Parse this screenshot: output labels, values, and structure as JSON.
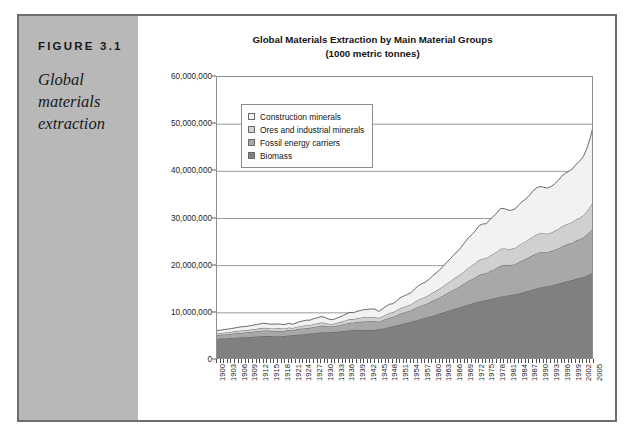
{
  "figure": {
    "number_label": "FIGURE 3.1",
    "caption": "Global materials extraction"
  },
  "chart": {
    "title_line1": "Global Materials Extraction by Main Material Groups",
    "title_line2": "(1000 metric tonnes)"
  },
  "legend": {
    "position": "inside-upper-left",
    "items": [
      {
        "label": "Construction minerals",
        "color": "#f2f2f2"
      },
      {
        "label": "Ores and industrial minerals",
        "color": "#d0d0d0"
      },
      {
        "label": "Fossil energy carriers",
        "color": "#a8a8a8"
      },
      {
        "label": "Biomass",
        "color": "#808080"
      }
    ]
  },
  "axes": {
    "y_tick_labels": [
      "0",
      "10,000,000",
      "20,000,000",
      "30,000,000",
      "40,000,000",
      "50,000,000",
      "60,000,000"
    ],
    "y_tick_values": [
      0,
      10000000,
      20000000,
      30000000,
      40000000,
      50000000,
      60000000
    ],
    "x_tick_labels": [
      "1900",
      "1903",
      "1906",
      "1909",
      "1912",
      "1915",
      "1918",
      "1921",
      "1924",
      "1927",
      "1930",
      "1933",
      "1936",
      "1939",
      "1942",
      "1945",
      "1948",
      "1951",
      "1954",
      "1957",
      "1960",
      "1963",
      "1966",
      "1969",
      "1972",
      "1975",
      "1978",
      "1981",
      "1984",
      "1987",
      "1990",
      "1993",
      "1996",
      "1999",
      "2002",
      "2005"
    ]
  },
  "chart_data": {
    "type": "area",
    "stacked": true,
    "title": "Global Materials Extraction by Main Material Groups (1000 metric tonnes)",
    "xlabel": "",
    "ylabel": "",
    "ylim": [
      0,
      60000000
    ],
    "xlim": [
      1900,
      2005
    ],
    "grid": true,
    "grid_axis": "y",
    "legend_position": "inside-upper-left",
    "units": "1000 metric tonnes",
    "x": [
      1900,
      1901,
      1902,
      1903,
      1904,
      1905,
      1906,
      1907,
      1908,
      1909,
      1910,
      1911,
      1912,
      1913,
      1914,
      1915,
      1916,
      1917,
      1918,
      1919,
      1920,
      1921,
      1922,
      1923,
      1924,
      1925,
      1926,
      1927,
      1928,
      1929,
      1930,
      1931,
      1932,
      1933,
      1934,
      1935,
      1936,
      1937,
      1938,
      1939,
      1940,
      1941,
      1942,
      1943,
      1944,
      1945,
      1946,
      1947,
      1948,
      1949,
      1950,
      1951,
      1952,
      1953,
      1954,
      1955,
      1956,
      1957,
      1958,
      1959,
      1960,
      1961,
      1962,
      1963,
      1964,
      1965,
      1966,
      1967,
      1968,
      1969,
      1970,
      1971,
      1972,
      1973,
      1974,
      1975,
      1976,
      1977,
      1978,
      1979,
      1980,
      1981,
      1982,
      1983,
      1984,
      1985,
      1986,
      1987,
      1988,
      1989,
      1990,
      1991,
      1992,
      1993,
      1994,
      1995,
      1996,
      1997,
      1998,
      1999,
      2000,
      2001,
      2002,
      2003,
      2004,
      2005
    ],
    "series": [
      {
        "name": "Biomass",
        "color": "#808080",
        "values": [
          4500000,
          4540000,
          4580000,
          4620000,
          4660000,
          4710000,
          4760000,
          4800000,
          4840000,
          4890000,
          4940000,
          4980000,
          5030000,
          5080000,
          5100000,
          5080000,
          5060000,
          5050000,
          5050000,
          5120000,
          5200000,
          5260000,
          5330000,
          5400000,
          5470000,
          5540000,
          5610000,
          5680000,
          5760000,
          5830000,
          5880000,
          5900000,
          5930000,
          5990000,
          6060000,
          6130000,
          6210000,
          6300000,
          6380000,
          6420000,
          6400000,
          6380000,
          6370000,
          6380000,
          6420000,
          6500000,
          6640000,
          6800000,
          6980000,
          7160000,
          7350000,
          7540000,
          7730000,
          7920000,
          8120000,
          8330000,
          8540000,
          8750000,
          8960000,
          9180000,
          9400000,
          9620000,
          9850000,
          10080000,
          10320000,
          10560000,
          10800000,
          11040000,
          11280000,
          11520000,
          11760000,
          11980000,
          12180000,
          12380000,
          12560000,
          12700000,
          12880000,
          13060000,
          13250000,
          13430000,
          13580000,
          13680000,
          13780000,
          13920000,
          14100000,
          14300000,
          14520000,
          14740000,
          14960000,
          15180000,
          15380000,
          15500000,
          15620000,
          15760000,
          15940000,
          16140000,
          16360000,
          16580000,
          16780000,
          16980000,
          17200000,
          17400000,
          17620000,
          17900000,
          18250000,
          18700000
        ]
      },
      {
        "name": "Fossil energy carriers",
        "color": "#a8a8a8",
        "values": [
          760000,
          790000,
          820000,
          850000,
          880000,
          915000,
          950000,
          980000,
          1000000,
          1030000,
          1070000,
          1100000,
          1140000,
          1180000,
          1140000,
          1100000,
          1110000,
          1120000,
          1100000,
          1080000,
          1140000,
          1060000,
          1120000,
          1200000,
          1230000,
          1250000,
          1240000,
          1330000,
          1360000,
          1420000,
          1360000,
          1250000,
          1180000,
          1230000,
          1320000,
          1390000,
          1500000,
          1580000,
          1540000,
          1620000,
          1690000,
          1760000,
          1790000,
          1810000,
          1800000,
          1620000,
          1740000,
          1880000,
          1980000,
          1950000,
          2080000,
          2240000,
          2300000,
          2350000,
          2400000,
          2580000,
          2720000,
          2830000,
          2870000,
          2980000,
          3140000,
          3270000,
          3420000,
          3580000,
          3780000,
          3960000,
          4160000,
          4300000,
          4500000,
          4740000,
          5000000,
          5160000,
          5360000,
          5620000,
          5700000,
          5700000,
          5940000,
          6100000,
          6300000,
          6540000,
          6500000,
          6400000,
          6360000,
          6400000,
          6620000,
          6800000,
          6900000,
          7080000,
          7300000,
          7420000,
          7440000,
          7340000,
          7240000,
          7280000,
          7380000,
          7500000,
          7700000,
          7800000,
          7850000,
          7900000,
          8120000,
          8200000,
          8360000,
          8700000,
          9100000,
          9500000
        ]
      },
      {
        "name": "Ores and industrial minerals",
        "color": "#d0d0d0",
        "values": [
          380000,
          390000,
          400000,
          415000,
          430000,
          445000,
          465000,
          480000,
          470000,
          490000,
          510000,
          525000,
          545000,
          565000,
          540000,
          520000,
          530000,
          540000,
          520000,
          500000,
          530000,
          470000,
          510000,
          560000,
          580000,
          600000,
          590000,
          640000,
          660000,
          700000,
          650000,
          560000,
          520000,
          560000,
          620000,
          670000,
          740000,
          790000,
          750000,
          810000,
          860000,
          900000,
          920000,
          930000,
          910000,
          780000,
          850000,
          940000,
          1000000,
          990000,
          1070000,
          1170000,
          1200000,
          1230000,
          1260000,
          1380000,
          1460000,
          1520000,
          1530000,
          1600000,
          1700000,
          1780000,
          1870000,
          1970000,
          2100000,
          2200000,
          2320000,
          2400000,
          2520000,
          2670000,
          2820000,
          2900000,
          3020000,
          3180000,
          3200000,
          3170000,
          3300000,
          3380000,
          3480000,
          3610000,
          3560000,
          3470000,
          3430000,
          3450000,
          3570000,
          3670000,
          3720000,
          3820000,
          3950000,
          4020000,
          4040000,
          3980000,
          3920000,
          3940000,
          4010000,
          4100000,
          4220000,
          4290000,
          4330000,
          4380000,
          4510000,
          4580000,
          4700000,
          4950000,
          5260000,
          5600000
        ]
      },
      {
        "name": "Construction minerals",
        "color": "#f2f2f2",
        "values": [
          600000,
          620000,
          640000,
          670000,
          700000,
          730000,
          770000,
          800000,
          790000,
          830000,
          870000,
          900000,
          940000,
          980000,
          930000,
          890000,
          910000,
          930000,
          890000,
          850000,
          910000,
          800000,
          880000,
          970000,
          1010000,
          1050000,
          1030000,
          1130000,
          1180000,
          1260000,
          1160000,
          990000,
          900000,
          970000,
          1080000,
          1180000,
          1320000,
          1420000,
          1340000,
          1460000,
          1560000,
          1640000,
          1680000,
          1700000,
          1660000,
          1400000,
          1540000,
          1720000,
          1860000,
          1840000,
          2020000,
          2240000,
          2320000,
          2400000,
          2480000,
          2760000,
          2960000,
          3100000,
          3140000,
          3320000,
          3560000,
          3760000,
          3980000,
          4220000,
          4520000,
          4780000,
          5080000,
          5300000,
          5600000,
          5980000,
          6360000,
          6560000,
          6880000,
          7300000,
          7380000,
          7320000,
          7680000,
          7920000,
          8220000,
          8580000,
          8460000,
          8240000,
          8160000,
          8240000,
          8560000,
          8820000,
          8980000,
          9280000,
          9640000,
          9860000,
          9940000,
          9800000,
          9680000,
          9760000,
          9980000,
          10300000,
          10680000,
          10900000,
          11080000,
          11260000,
          11680000,
          11950000,
          12400000,
          13300000,
          14600000,
          16500000
        ]
      }
    ],
    "totals": {
      "1900": 6240000,
      "1950": 12520000,
      "1970": 25540000,
      "2000": 41000000,
      "2005": 50300000
    }
  }
}
